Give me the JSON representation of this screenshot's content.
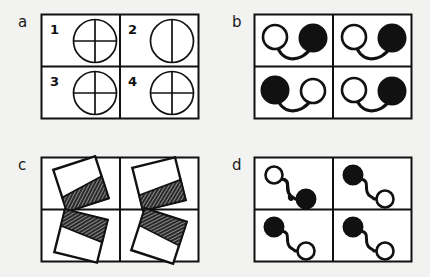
{
  "figure": {
    "width": 430,
    "height": 277,
    "background_color": "#f2f2f0",
    "ink_color": "#111111",
    "fill_color": "#ffffff"
  },
  "panels": [
    {
      "id": "a",
      "label": "a",
      "label_x": 18,
      "label_y": 22,
      "frame": {
        "x": 41,
        "y": 14,
        "w": 157,
        "h": 104
      },
      "cells": [
        {
          "index": 0,
          "number": "1",
          "object": "circle-with-cross",
          "lines": [
            "vertical",
            "horizontal"
          ]
        },
        {
          "index": 1,
          "number": "2",
          "object": "circle-with-vertical-line",
          "lines": [
            "vertical"
          ]
        },
        {
          "index": 2,
          "number": "3",
          "object": "circle-with-cross",
          "lines": [
            "vertical",
            "horizontal"
          ]
        },
        {
          "index": 3,
          "number": "4",
          "object": "circle-with-cross",
          "lines": [
            "vertical",
            "horizontal"
          ]
        }
      ]
    },
    {
      "id": "b",
      "label": "b",
      "label_x": 232,
      "label_y": 22,
      "frame": {
        "x": 254,
        "y": 14,
        "w": 157,
        "h": 104
      },
      "cells": [
        {
          "index": 0,
          "object": "linked-circle-pair",
          "left_circle": "white",
          "right_circle": "black",
          "connector": "downward-arc"
        },
        {
          "index": 1,
          "object": "linked-circle-pair",
          "left_circle": "white",
          "right_circle": "black",
          "connector": "downward-arc"
        },
        {
          "index": 2,
          "object": "linked-circle-pair",
          "left_circle": "black",
          "right_circle": "white",
          "connector": "downward-arc"
        },
        {
          "index": 3,
          "object": "linked-circle-pair",
          "left_circle": "white",
          "right_circle": "black",
          "connector": "downward-arc"
        }
      ]
    },
    {
      "id": "c",
      "label": "c",
      "label_x": 18,
      "label_y": 167,
      "frame": {
        "x": 41,
        "y": 157,
        "w": 157,
        "h": 104
      },
      "cells": [
        {
          "index": 0,
          "object": "tilted-square-with-hatched-wedge",
          "rotation_deg": -18,
          "wedge_side": "lower"
        },
        {
          "index": 1,
          "object": "tilted-square-with-hatched-wedge",
          "rotation_deg": -14,
          "wedge_side": "lower"
        },
        {
          "index": 2,
          "object": "tilted-square-with-hatched-wedge",
          "rotation_deg": 14,
          "wedge_side": "upper"
        },
        {
          "index": 3,
          "object": "tilted-square-with-hatched-wedge",
          "rotation_deg": 18,
          "wedge_side": "upper"
        }
      ]
    },
    {
      "id": "d",
      "label": "d",
      "label_x": 232,
      "label_y": 167,
      "frame": {
        "x": 254,
        "y": 157,
        "w": 157,
        "h": 104
      },
      "cells": [
        {
          "index": 0,
          "object": "s-curve-circle-pair",
          "top_left_circle": "white",
          "bottom_right_circle": "black",
          "connector": "s-curve"
        },
        {
          "index": 1,
          "object": "s-curve-circle-pair",
          "top_left_circle": "black",
          "bottom_right_circle": "white",
          "connector": "s-curve"
        },
        {
          "index": 2,
          "object": "s-curve-circle-pair",
          "top_left_circle": "black",
          "bottom_right_circle": "white",
          "connector": "s-curve"
        },
        {
          "index": 3,
          "object": "s-curve-circle-pair",
          "top_left_circle": "black",
          "bottom_right_circle": "white",
          "connector": "s-curve"
        }
      ]
    }
  ]
}
